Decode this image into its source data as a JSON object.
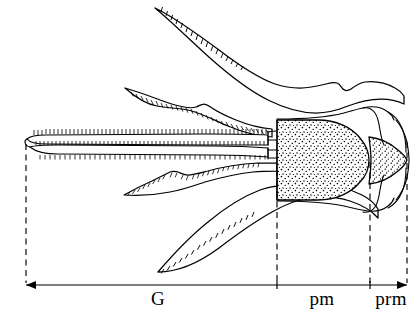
{
  "figure": {
    "kind": "scientific-line-drawing",
    "background_color": "#ffffff",
    "ink_color": "#000000"
  },
  "measurements": {
    "axis": {
      "y": 285,
      "x_start": 26,
      "x_end": 407,
      "left_arrow": true,
      "right_arrow": true
    },
    "dividers": [
      {
        "name": "galea-base-divider",
        "x": 26,
        "y_top": 141,
        "y_bottom": 285
      },
      {
        "name": "postmentum-start-divider",
        "x": 277,
        "y_top": 168,
        "y_bottom": 285
      },
      {
        "name": "prementum-start-divider",
        "x": 370,
        "y_top": 160,
        "y_bottom": 285
      },
      {
        "name": "prementum-end-divider",
        "x": 407,
        "y_top": 140,
        "y_bottom": 285
      }
    ],
    "segments": [
      {
        "id": "galea",
        "label": "G",
        "label_x": 158,
        "label_y": 305,
        "x_from": 26,
        "x_to": 277
      },
      {
        "id": "postmentum",
        "label": "pm",
        "label_x": 322,
        "label_y": 305,
        "x_from": 277,
        "x_to": 370
      },
      {
        "id": "prementum",
        "label": "prm",
        "label_x": 391,
        "label_y": 305,
        "x_from": 370,
        "x_to": 407
      }
    ]
  },
  "parts": {
    "galea_label": "G",
    "postmentum_label": "pm",
    "prementum_label": "prm"
  },
  "stipple": {
    "postmentum_dot_color": "#000000",
    "prementum_dot_color": "#000000",
    "dot_radius": 0.72
  }
}
